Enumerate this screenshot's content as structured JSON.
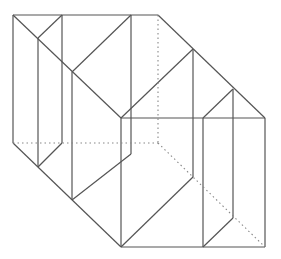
{
  "figure": {
    "type": "3d-solid-line-drawing",
    "colors": {
      "background": "#ffffff",
      "edge": "#555555",
      "hidden_edge": "#888888"
    },
    "solid_edges": [
      [
        13,
        15,
        158,
        15
      ],
      [
        13,
        15,
        13,
        143
      ],
      [
        62,
        15,
        62,
        143
      ],
      [
        131,
        15,
        131,
        154
      ],
      [
        13,
        15,
        121,
        118
      ],
      [
        62,
        15,
        38,
        38
      ],
      [
        38,
        38,
        38,
        167
      ],
      [
        131,
        15,
        72,
        72
      ],
      [
        72,
        72,
        72,
        200
      ],
      [
        158,
        15,
        265,
        118
      ],
      [
        121,
        118,
        265,
        118
      ],
      [
        121,
        118,
        121,
        247
      ],
      [
        193,
        49,
        193,
        177
      ],
      [
        193,
        49,
        121,
        118
      ],
      [
        233,
        89,
        233,
        218
      ],
      [
        233,
        89,
        203,
        118
      ],
      [
        203,
        118,
        203,
        247
      ],
      [
        265,
        118,
        265,
        247
      ],
      [
        121,
        247,
        265,
        247
      ],
      [
        13,
        143,
        121,
        247
      ],
      [
        62,
        143,
        38,
        167
      ],
      [
        131,
        154,
        72,
        200
      ],
      [
        193,
        177,
        121,
        247
      ],
      [
        233,
        218,
        203,
        247
      ]
    ],
    "hidden_edges": [
      [
        158,
        15,
        158,
        143
      ],
      [
        13,
        143,
        158,
        143
      ],
      [
        158,
        143,
        265,
        247
      ]
    ]
  }
}
